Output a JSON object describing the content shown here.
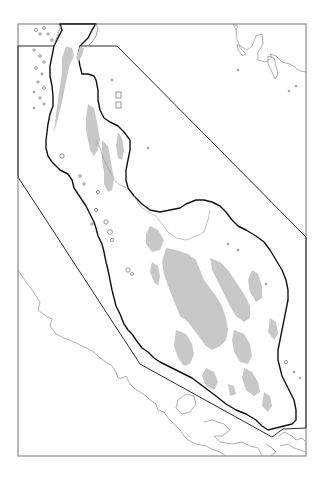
{
  "map": {
    "type": "outline-map",
    "region": "peninsula outline with shaded highlands",
    "colors": {
      "background": "#ffffff",
      "land_outline": "#111111",
      "highland_fill": "#c8c8c8",
      "frame": "#8a8a8a",
      "boundary_polygon": "#2a2a2a",
      "neighbor_coast": "#8f8f8f"
    },
    "frame": {
      "x": 18,
      "y": 24,
      "width": 288,
      "height": 432
    },
    "boundary_polygon_points": "18,46 117,46 306,237 306,428 283,429 272,437 140,364 18,177",
    "side_label": ""
  }
}
